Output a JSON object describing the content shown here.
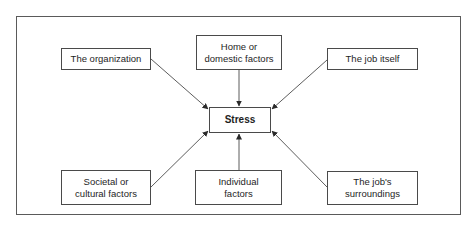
{
  "diagram": {
    "center": {
      "label": "Stress"
    },
    "factors": [
      {
        "id": "organization",
        "label": "The organization"
      },
      {
        "id": "home",
        "label": "Home or domestic factors"
      },
      {
        "id": "job-itself",
        "label": "The job itself"
      },
      {
        "id": "societal",
        "label": "Societal or cultural factors"
      },
      {
        "id": "individual",
        "label": "Individual factors"
      },
      {
        "id": "job-surroundings",
        "label": "The job's surroundings"
      }
    ],
    "edges": [
      {
        "from": "organization",
        "to": "center"
      },
      {
        "from": "home",
        "to": "center"
      },
      {
        "from": "job-itself",
        "to": "center"
      },
      {
        "from": "societal",
        "to": "center"
      },
      {
        "from": "individual",
        "to": "center"
      },
      {
        "from": "job-surroundings",
        "to": "center"
      }
    ]
  }
}
